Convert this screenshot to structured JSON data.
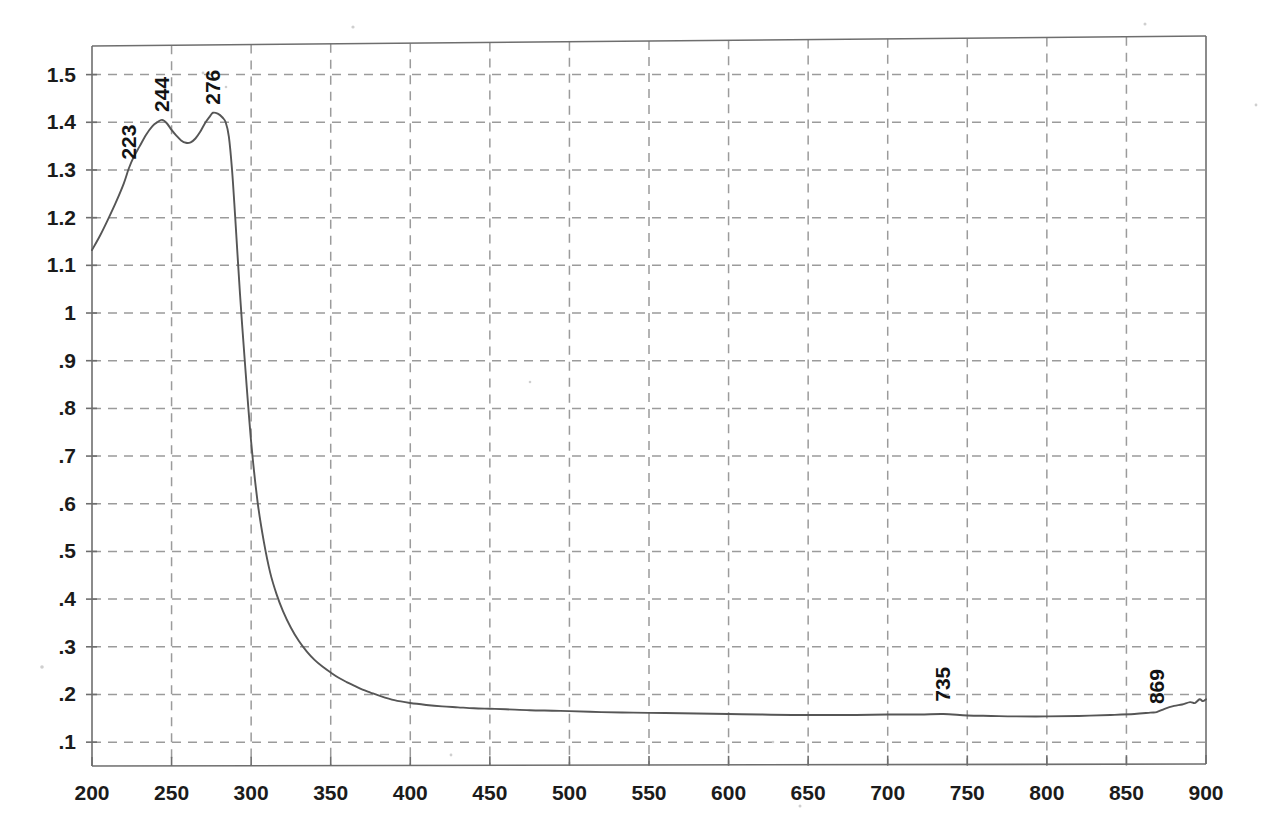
{
  "chart_data": {
    "type": "line",
    "title": "",
    "subtitle": "",
    "xlabel": "",
    "ylabel": "",
    "xlim": [
      200,
      900
    ],
    "ylim": [
      0.05,
      1.56
    ],
    "grid": true,
    "legend_position": "none",
    "x_ticks": [
      200,
      250,
      300,
      350,
      400,
      450,
      500,
      550,
      600,
      650,
      700,
      750,
      800,
      850,
      900
    ],
    "x_tick_labels": [
      "200",
      "250",
      "300",
      "350",
      "400",
      "450",
      "500",
      "550",
      "600",
      "650",
      "700",
      "750",
      "800",
      "850",
      "900"
    ],
    "y_ticks": [
      0.1,
      0.2,
      0.3,
      0.4,
      0.5,
      0.6,
      0.7,
      0.8,
      0.9,
      1.0,
      1.1,
      1.2,
      1.3,
      1.4,
      1.5
    ],
    "y_tick_labels": [
      ".1",
      ".2",
      ".3",
      ".4",
      ".5",
      ".6",
      ".7",
      ".8",
      ".9",
      "1",
      "1.1",
      "1.2",
      "1.3",
      "1.4",
      "1.5"
    ],
    "annotations": [
      {
        "label": "223",
        "x": 223,
        "y": 1.305,
        "rotation": -90
      },
      {
        "label": "244",
        "x": 244,
        "y": 1.405,
        "rotation": -90
      },
      {
        "label": "276",
        "x": 276,
        "y": 1.42,
        "rotation": -90
      },
      {
        "label": "735",
        "x": 735,
        "y": 0.168,
        "rotation": -90
      },
      {
        "label": "869",
        "x": 869,
        "y": 0.163,
        "rotation": -90
      }
    ],
    "series": [
      {
        "name": "Absorbance",
        "x": [
          200,
          205,
          210,
          215,
          220,
          223,
          226,
          230,
          234,
          238,
          241,
          244,
          247,
          250,
          253,
          256,
          259,
          262,
          265,
          268,
          271,
          274,
          276,
          279,
          282,
          284,
          286,
          288,
          290,
          293,
          296,
          300,
          304,
          308,
          312,
          316,
          320,
          325,
          330,
          335,
          340,
          345,
          350,
          355,
          360,
          365,
          370,
          375,
          380,
          390,
          400,
          410,
          420,
          430,
          440,
          450,
          460,
          475,
          490,
          500,
          520,
          540,
          560,
          580,
          600,
          620,
          640,
          660,
          680,
          700,
          720,
          735,
          750,
          765,
          780,
          800,
          820,
          840,
          855,
          865,
          869,
          874,
          880,
          885,
          890,
          893,
          896,
          898,
          900
        ],
        "y": [
          1.132,
          1.162,
          1.196,
          1.232,
          1.272,
          1.302,
          1.326,
          1.35,
          1.374,
          1.392,
          1.4,
          1.405,
          1.398,
          1.384,
          1.372,
          1.362,
          1.357,
          1.358,
          1.366,
          1.38,
          1.398,
          1.412,
          1.42,
          1.418,
          1.41,
          1.4,
          1.37,
          1.3,
          1.2,
          1.04,
          0.9,
          0.73,
          0.605,
          0.52,
          0.455,
          0.41,
          0.375,
          0.34,
          0.312,
          0.29,
          0.272,
          0.258,
          0.246,
          0.235,
          0.226,
          0.218,
          0.21,
          0.204,
          0.198,
          0.188,
          0.182,
          0.178,
          0.175,
          0.173,
          0.171,
          0.17,
          0.169,
          0.167,
          0.166,
          0.165,
          0.163,
          0.162,
          0.161,
          0.16,
          0.159,
          0.158,
          0.157,
          0.157,
          0.157,
          0.158,
          0.158,
          0.159,
          0.156,
          0.155,
          0.154,
          0.154,
          0.155,
          0.157,
          0.159,
          0.162,
          0.163,
          0.17,
          0.176,
          0.179,
          0.184,
          0.182,
          0.19,
          0.186,
          0.19
        ]
      }
    ],
    "colors": {
      "curve": "#565656",
      "grid": "#9b9b9b",
      "frame": "#6e6e6e",
      "text": "#1b1b1b",
      "background": "#ffffff"
    }
  }
}
